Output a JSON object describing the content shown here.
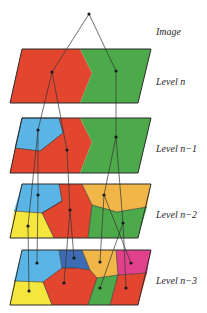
{
  "diagram": {
    "type": "hierarchical-region-pyramid",
    "labels": {
      "image": "Image",
      "level_n": "Level n",
      "level_n1": "Level n−1",
      "level_n2": "Level n−2",
      "level_n3": "Level n−3"
    },
    "colors": {
      "red": "#e2462e",
      "green": "#4caa4a",
      "blue": "#5ab4e6",
      "yellow": "#f4e63c",
      "orange": "#f1b648",
      "darkblue": "#3d6cb4",
      "magenta": "#e0418a",
      "outline": "#2b2b2b",
      "line": "#333333",
      "dot": "#1a1a1a"
    },
    "levels": [
      {
        "name": "Level n",
        "regions": [
          "red",
          "green"
        ]
      },
      {
        "name": "Level n-1",
        "regions": [
          "blue",
          "red",
          "green"
        ]
      },
      {
        "name": "Level n-2",
        "regions": [
          "blue",
          "yellow",
          "red",
          "orange",
          "green"
        ]
      },
      {
        "name": "Level n-3",
        "regions": [
          "blue",
          "darkblue",
          "orange",
          "magenta",
          "yellow",
          "red",
          "green",
          "red"
        ]
      }
    ]
  }
}
